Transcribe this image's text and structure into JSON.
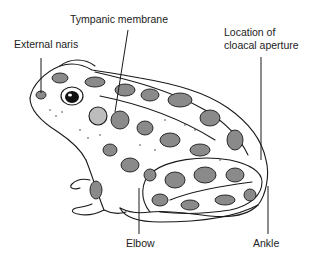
{
  "diagram": {
    "labels": [
      {
        "id": "tympanic",
        "text": "Tympanic membrane",
        "x": 70,
        "y": 17
      },
      {
        "id": "naris",
        "text": "External naris",
        "x": 14,
        "y": 42
      },
      {
        "id": "cloaca_1",
        "text": "Location of",
        "x": 224,
        "y": 30
      },
      {
        "id": "cloaca_2",
        "text": "cloacal aperture",
        "x": 224,
        "y": 42
      },
      {
        "id": "elbow",
        "text": "Elbow",
        "x": 126,
        "y": 243
      },
      {
        "id": "ankle",
        "text": "Ankle",
        "x": 253,
        "y": 243
      }
    ],
    "leader_lines": [
      {
        "label": "Tympanic membrane",
        "x1": 128,
        "y1": 30,
        "x2": 115,
        "y2": 112
      },
      {
        "label": "External naris",
        "x1": 41,
        "y1": 58,
        "x2": 41,
        "y2": 93
      },
      {
        "label": "Location of cloacal aperture",
        "x1": 261,
        "y1": 57,
        "x2": 261,
        "y2": 160
      },
      {
        "label": "Elbow",
        "x1": 139,
        "y1": 234,
        "x2": 139,
        "y2": 188
      },
      {
        "label": "Ankle",
        "x1": 268,
        "y1": 234,
        "x2": 268,
        "y2": 186
      }
    ],
    "colors": {
      "ink": "#1a1a1a",
      "background": "#ffffff",
      "spot_fill": "#8a8a8a"
    }
  }
}
